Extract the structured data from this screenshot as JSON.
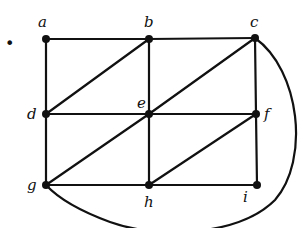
{
  "diagram": {
    "type": "graph",
    "bullet": "•",
    "nodes": [
      {
        "id": "a",
        "label": "a",
        "x": 46,
        "y": 39,
        "lx": 38,
        "ly": 27
      },
      {
        "id": "b",
        "label": "b",
        "x": 149,
        "y": 39,
        "lx": 144,
        "ly": 27
      },
      {
        "id": "c",
        "label": "c",
        "x": 255,
        "y": 38,
        "lx": 250,
        "ly": 27
      },
      {
        "id": "d",
        "label": "d",
        "x": 46,
        "y": 114,
        "lx": 27,
        "ly": 119
      },
      {
        "id": "e",
        "label": "e",
        "x": 149,
        "y": 114,
        "lx": 137,
        "ly": 108
      },
      {
        "id": "f",
        "label": "f",
        "x": 256,
        "y": 114,
        "lx": 264,
        "ly": 119
      },
      {
        "id": "g",
        "label": "g",
        "x": 46,
        "y": 185,
        "lx": 27,
        "ly": 190
      },
      {
        "id": "h",
        "label": "h",
        "x": 149,
        "y": 185,
        "lx": 144,
        "ly": 207
      },
      {
        "id": "i",
        "label": "i",
        "x": 257,
        "y": 185,
        "lx": 243,
        "ly": 202
      }
    ],
    "edges": [
      [
        "a",
        "b"
      ],
      [
        "b",
        "c"
      ],
      [
        "a",
        "d"
      ],
      [
        "b",
        "e"
      ],
      [
        "c",
        "f"
      ],
      [
        "d",
        "e"
      ],
      [
        "e",
        "f"
      ],
      [
        "d",
        "g"
      ],
      [
        "e",
        "h"
      ],
      [
        "f",
        "i"
      ],
      [
        "g",
        "h"
      ],
      [
        "h",
        "i"
      ],
      [
        "d",
        "b"
      ],
      [
        "e",
        "c"
      ],
      [
        "g",
        "e"
      ],
      [
        "h",
        "f"
      ]
    ],
    "curved_edges": [
      {
        "from": "c",
        "to": "g",
        "path": "M255,38 C300,70 310,160 275,200 C240,235 160,240 110,222 C80,211 58,198 46,185"
      }
    ]
  }
}
